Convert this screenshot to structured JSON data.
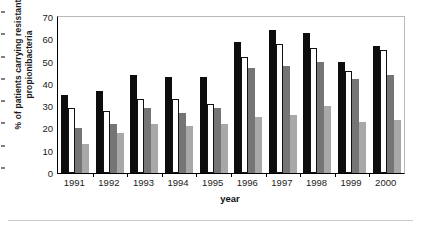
{
  "chart_data": {
    "type": "bar",
    "title": "",
    "xlabel": "year",
    "ylabel": "% of patients carrying resistant propionibacteria",
    "categories": [
      "1991",
      "1992",
      "1993",
      "1994",
      "1995",
      "1996",
      "1997",
      "1998",
      "1999",
      "2000"
    ],
    "ylim": [
      0,
      70
    ],
    "yticks": [
      0,
      10,
      20,
      30,
      40,
      50,
      60,
      70
    ],
    "grid": false,
    "legend": "none",
    "series": [
      {
        "name": "series-1",
        "color": "#0d0d0d",
        "values": [
          35,
          37,
          44,
          43,
          43,
          59,
          64,
          63,
          50,
          57
        ]
      },
      {
        "name": "series-2",
        "color": "#ffffff",
        "values": [
          29,
          28,
          33,
          33,
          31,
          52,
          58,
          56,
          46,
          55
        ]
      },
      {
        "name": "series-3",
        "color": "#757575",
        "values": [
          20,
          22,
          29,
          27,
          29,
          47,
          48,
          50,
          42,
          44
        ]
      },
      {
        "name": "series-4",
        "color": "#a8a8a8",
        "values": [
          13,
          18,
          22,
          21,
          22,
          25,
          26,
          30,
          23,
          24
        ]
      }
    ]
  }
}
